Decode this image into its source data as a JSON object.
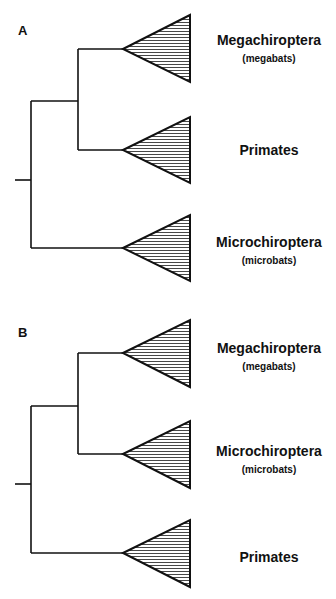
{
  "panels": [
    {
      "label": "A",
      "taxa": [
        {
          "name": "Megachiroptera",
          "common": "(megabats)"
        },
        {
          "name": "Primates",
          "common": ""
        },
        {
          "name": "Microchiroptera",
          "common": "(microbats)"
        }
      ],
      "topology": "((Megachiroptera, Primates), Microchiroptera)"
    },
    {
      "label": "B",
      "taxa": [
        {
          "name": "Megachiroptera",
          "common": "(megabats)"
        },
        {
          "name": "Microchiroptera",
          "common": "(microbats)"
        },
        {
          "name": "Primates",
          "common": ""
        }
      ],
      "topology": "((Megachiroptera, Microchiroptera), Primates)"
    }
  ],
  "colors": {
    "line": "#111111",
    "hatch": "#333333",
    "background": "#ffffff"
  }
}
